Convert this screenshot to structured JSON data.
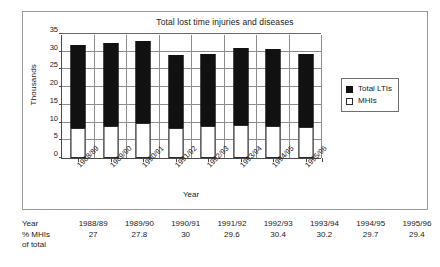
{
  "chart_data": {
    "type": "bar",
    "title": "Total lost time injuries and diseases",
    "xlabel": "Year",
    "ylabel": "Thousands",
    "ylim": [
      0,
      35
    ],
    "yticks": [
      0,
      5,
      10,
      15,
      20,
      25,
      30,
      35
    ],
    "grid": true,
    "stacked": true,
    "legend_position": "right",
    "categories": [
      "1988/89",
      "1989/90",
      "1990/91",
      "1991/92",
      "1992/93",
      "1993/94",
      "1994/95",
      "1995/96"
    ],
    "series": [
      {
        "name": "Total LTIs",
        "color": "#111111",
        "values": [
          32.0,
          32.5,
          33.0,
          29.0,
          29.5,
          31.0,
          30.8,
          29.5
        ]
      },
      {
        "name": "MHIs",
        "color": "#ffffff",
        "values": [
          8.6,
          9.0,
          10.0,
          8.5,
          9.0,
          9.4,
          9.1,
          8.7
        ]
      }
    ]
  },
  "chart": {
    "title": "Total lost time injuries and diseases",
    "yaxis_label": "Thousands",
    "xaxis_label": "Year",
    "yticks": [
      "0",
      "5",
      "10",
      "15",
      "20",
      "25",
      "30",
      "35"
    ],
    "xlabels": [
      "1988/89",
      "1989/90",
      "1990/91",
      "1991/92",
      "1992/93",
      "1993/94",
      "1994/95",
      "1995/96"
    ]
  },
  "legend": {
    "items": [
      {
        "label": "Total LTIs",
        "swatch": "filled"
      },
      {
        "label": "MHIs",
        "swatch": "hollow"
      }
    ]
  },
  "table": {
    "row_labels": {
      "year": "Year",
      "pct_line1": "% MHIs",
      "pct_line2": "of total"
    },
    "columns": [
      {
        "year": "1988/89",
        "pct": "27"
      },
      {
        "year": "1989/90",
        "pct": "27.8"
      },
      {
        "year": "1990/91",
        "pct": "30"
      },
      {
        "year": "1991/92",
        "pct": "29.6"
      },
      {
        "year": "1992/93",
        "pct": "30.4"
      },
      {
        "year": "1993/94",
        "pct": "30.2"
      },
      {
        "year": "1994/95",
        "pct": "29.7"
      },
      {
        "year": "1995/96",
        "pct": "29.4"
      }
    ]
  }
}
